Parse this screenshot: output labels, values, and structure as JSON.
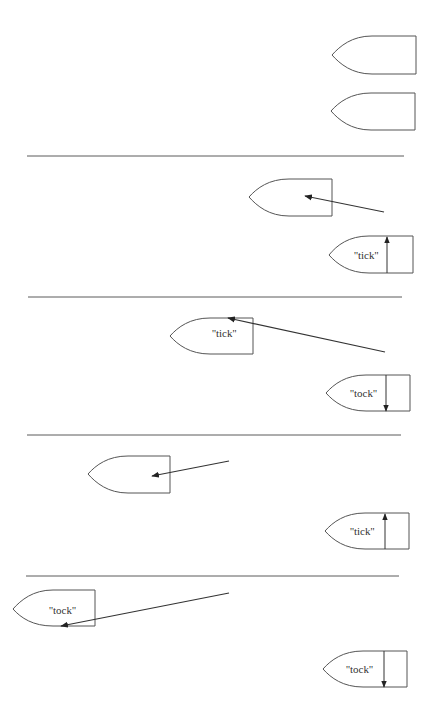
{
  "figure": {
    "colors": {
      "stroke": "#555555",
      "arrow": "#333333",
      "background": "#ffffff"
    },
    "panels": [
      {
        "id": 1,
        "moving_boat": {
          "label": "",
          "has_arrow": false
        },
        "clock_boat": {
          "label": "",
          "pendulum": "none"
        }
      },
      {
        "id": 2,
        "moving_boat": {
          "label": "",
          "has_arrow": true
        },
        "clock_boat": {
          "label": "''tick''",
          "pendulum": "up"
        }
      },
      {
        "id": 3,
        "moving_boat": {
          "label": "''tick''",
          "has_arrow": true
        },
        "clock_boat": {
          "label": "''tock''",
          "pendulum": "down"
        }
      },
      {
        "id": 4,
        "moving_boat": {
          "label": "",
          "has_arrow": true
        },
        "clock_boat": {
          "label": "''tick''",
          "pendulum": "up"
        }
      },
      {
        "id": 5,
        "moving_boat": {
          "label": "''tock''",
          "has_arrow": true
        },
        "clock_boat": {
          "label": "''tock''",
          "pendulum": "down"
        }
      }
    ]
  }
}
